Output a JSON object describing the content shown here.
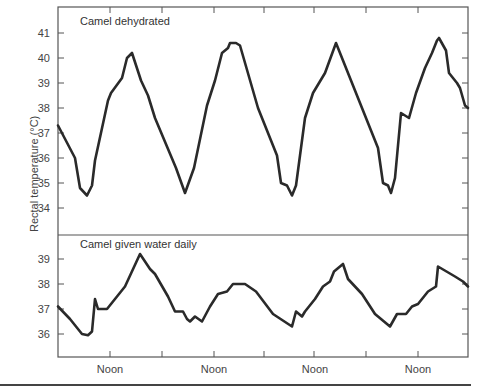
{
  "chart_data": {
    "type": "line",
    "ylabel": "Rectal temperature (°C)",
    "xlabel": "",
    "x_tick_labels": [
      "Noon",
      "Noon",
      "Noon",
      "Noon"
    ],
    "grid": false,
    "panels": [
      {
        "title": "Camel dehydrated",
        "ylim": [
          33,
          41.3
        ],
        "yticks": [
          34,
          35,
          36,
          37,
          38,
          39,
          40,
          41
        ],
        "series": [
          {
            "name": "Camel dehydrated",
            "x": [
              58,
              75,
              80,
              87,
              92,
              95,
              108,
              111,
              122,
              127,
              132,
              141,
              148,
              155,
              176,
              185,
              194,
              207,
              215,
              222,
              228,
              230,
              236,
              240,
              258,
              277,
              281,
              287,
              292,
              296,
              305,
              313,
              325,
              336,
              350,
              378,
              383,
              388,
              391,
              395,
              401,
              409,
              416,
              425,
              432,
              437,
              439,
              446,
              449,
              457,
              460,
              465,
              468
            ],
            "values": [
              37.3,
              36.0,
              34.8,
              34.5,
              34.9,
              35.9,
              38.3,
              38.6,
              39.2,
              40.0,
              40.2,
              39.1,
              38.5,
              37.6,
              35.6,
              34.6,
              35.6,
              38.1,
              39.1,
              40.2,
              40.4,
              40.6,
              40.6,
              40.5,
              38.0,
              36.1,
              35.0,
              34.9,
              34.5,
              34.9,
              37.6,
              38.6,
              39.4,
              40.6,
              39.2,
              36.4,
              35.0,
              34.9,
              34.6,
              35.2,
              37.8,
              37.6,
              38.6,
              39.6,
              40.2,
              40.7,
              40.8,
              40.3,
              39.4,
              39.0,
              38.8,
              38.1,
              38.0
            ]
          }
        ]
      },
      {
        "title": "Camel given water daily",
        "ylim": [
          35.1,
          39.9
        ],
        "yticks": [
          36,
          37,
          38,
          39
        ],
        "series": [
          {
            "name": "Camel given water daily",
            "x": [
              58,
              70,
              82,
              88,
              92,
              95,
              98,
              107,
              125,
              140,
              150,
              155,
              168,
              175,
              183,
              187,
              190,
              195,
              202,
              210,
              218,
              227,
              233,
              245,
              256,
              273,
              292,
              296,
              302,
              305,
              315,
              323,
              330,
              334,
              343,
              348,
              362,
              375,
              390,
              397,
              406,
              412,
              418,
              428,
              436,
              438,
              455,
              463,
              468
            ],
            "values": [
              37.1,
              36.6,
              36.0,
              35.95,
              36.1,
              37.4,
              37.0,
              37.0,
              37.9,
              39.2,
              38.6,
              38.4,
              37.5,
              36.9,
              36.9,
              36.6,
              36.5,
              36.7,
              36.5,
              37.1,
              37.6,
              37.7,
              38.0,
              38.0,
              37.7,
              36.8,
              36.3,
              36.9,
              36.7,
              36.9,
              37.4,
              37.9,
              38.1,
              38.5,
              38.8,
              38.2,
              37.6,
              36.8,
              36.3,
              36.8,
              36.8,
              37.1,
              37.2,
              37.7,
              37.9,
              38.7,
              38.3,
              38.1,
              37.9
            ]
          }
        ]
      }
    ]
  },
  "layout": {
    "frame": {
      "left": 58,
      "right": 468,
      "top": 7,
      "bottom": 357,
      "divider": 235
    },
    "top_panel": {
      "y_for_41": 33,
      "px_per_deg": 25
    },
    "bottom_panel": {
      "y_for_39": 259,
      "px_per_deg": 25
    },
    "x_ticks": [
      110,
      162,
      214,
      264,
      314,
      366,
      418
    ],
    "noon_positions": [
      110,
      214,
      315,
      418
    ]
  },
  "colors": {
    "line": "#2a2a2a",
    "axis": "#555555",
    "text": "#444444"
  }
}
